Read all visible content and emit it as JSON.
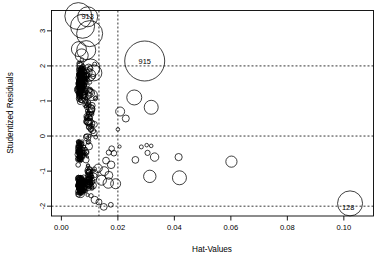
{
  "chart_data": {
    "type": "scatter",
    "title": "",
    "xlabel": "Hat-Values",
    "ylabel": "Studentized Residuals",
    "xlim": [
      -0.0035,
      0.1105
    ],
    "ylim": [
      -2.28,
      3.58
    ],
    "grid": false,
    "legend": null,
    "xticks": [
      0.0,
      0.02,
      0.04,
      0.06,
      0.08,
      0.1
    ],
    "xticklabels": [
      "0.00",
      "0.02",
      "0.04",
      "0.06",
      "0.08",
      "0.10"
    ],
    "yticks": [
      -2,
      -1,
      0,
      1,
      2,
      3
    ],
    "yticklabels": [
      "-2",
      "-1",
      "0",
      "1",
      "2",
      "3"
    ],
    "reference_lines": {
      "horizontal": [
        -2,
        0,
        2
      ],
      "vertical": [
        0.0133,
        0.02
      ],
      "style": "dotted"
    },
    "size_encoding": "Cook's distance (bubble radius)",
    "annotations": [
      {
        "label": "913",
        "x": 0.0093,
        "y": 3.42
      },
      {
        "label": "915",
        "x": 0.0295,
        "y": 2.14
      },
      {
        "label": "128",
        "x": 0.1015,
        "y": -2.04
      }
    ],
    "points": [
      {
        "x": 0.006,
        "y": 3.42,
        "r": 13.5
      },
      {
        "x": 0.0093,
        "y": 3.4,
        "r": 10.0
      },
      {
        "x": 0.0075,
        "y": 3.13,
        "r": 12.0
      },
      {
        "x": 0.01,
        "y": 2.92,
        "r": 13.0
      },
      {
        "x": 0.0062,
        "y": 2.48,
        "r": 7.5
      },
      {
        "x": 0.0088,
        "y": 2.45,
        "r": 9.5
      },
      {
        "x": 0.0072,
        "y": 2.3,
        "r": 6.5
      },
      {
        "x": 0.0295,
        "y": 2.14,
        "r": 20.0
      },
      {
        "x": 0.0104,
        "y": 1.94,
        "r": 9.0
      },
      {
        "x": 0.0115,
        "y": 1.8,
        "r": 8.0
      },
      {
        "x": 0.01,
        "y": 1.74,
        "r": 6.0
      },
      {
        "x": 0.0108,
        "y": 1.17,
        "r": 5.5
      },
      {
        "x": 0.0258,
        "y": 1.1,
        "r": 7.5
      },
      {
        "x": 0.0318,
        "y": 0.82,
        "r": 7.0
      },
      {
        "x": 0.0208,
        "y": 0.7,
        "r": 4.5
      },
      {
        "x": 0.0228,
        "y": 0.5,
        "r": 3.5
      },
      {
        "x": 0.0097,
        "y": 0.53,
        "r": 3.0
      },
      {
        "x": 0.02,
        "y": 0.19,
        "r": 1.8
      },
      {
        "x": 0.0206,
        "y": -0.3,
        "r": 1.6
      },
      {
        "x": 0.0283,
        "y": -0.31,
        "r": 2.0
      },
      {
        "x": 0.0302,
        "y": -0.26,
        "r": 1.8
      },
      {
        "x": 0.0318,
        "y": -0.28,
        "r": 1.8
      },
      {
        "x": 0.0305,
        "y": -0.48,
        "r": 2.6
      },
      {
        "x": 0.0262,
        "y": -0.68,
        "r": 3.4
      },
      {
        "x": 0.033,
        "y": -0.6,
        "r": 4.2
      },
      {
        "x": 0.0415,
        "y": -0.6,
        "r": 3.6
      },
      {
        "x": 0.0602,
        "y": -0.73,
        "r": 5.6
      },
      {
        "x": 0.0313,
        "y": -1.15,
        "r": 6.2
      },
      {
        "x": 0.0418,
        "y": -1.19,
        "r": 7.0
      },
      {
        "x": 0.1022,
        "y": -1.92,
        "r": 12.5
      },
      {
        "x": 0.0178,
        "y": -0.36,
        "r": 2.8
      },
      {
        "x": 0.0168,
        "y": -0.47,
        "r": 2.6
      },
      {
        "x": 0.0186,
        "y": -0.49,
        "r": 2.8
      },
      {
        "x": 0.0158,
        "y": -0.7,
        "r": 3.4
      },
      {
        "x": 0.0176,
        "y": -0.82,
        "r": 3.8
      },
      {
        "x": 0.013,
        "y": -0.92,
        "r": 4.2
      },
      {
        "x": 0.0152,
        "y": -1.0,
        "r": 4.4
      },
      {
        "x": 0.0168,
        "y": -1.12,
        "r": 4.0
      },
      {
        "x": 0.0142,
        "y": -1.26,
        "r": 5.0
      },
      {
        "x": 0.0166,
        "y": -1.34,
        "r": 5.2
      },
      {
        "x": 0.0192,
        "y": -1.36,
        "r": 5.0
      },
      {
        "x": 0.0133,
        "y": -1.88,
        "r": 3.0
      },
      {
        "x": 0.015,
        "y": -2.02,
        "r": 3.4
      },
      {
        "x": 0.0118,
        "y": -1.82,
        "r": 3.6
      },
      {
        "x": 0.0175,
        "y": -1.96,
        "r": 2.4
      }
    ]
  },
  "figure": {
    "background_color": "#ffffff",
    "axis_color": "#000000",
    "point_stroke_color": "#000000"
  }
}
